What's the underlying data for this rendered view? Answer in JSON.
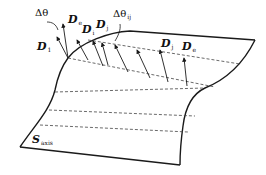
{
  "diagram": {
    "type": "surface-vector-diagram",
    "surface_label": {
      "main": "S",
      "sub": "axis"
    },
    "vector_labels": [
      {
        "main": "D",
        "sub": "1"
      },
      {
        "main": "D",
        "sub": "e"
      },
      {
        "main": "D",
        "sub": "i"
      },
      {
        "main": "D",
        "sub": "j"
      },
      {
        "main": "D",
        "sub": "j"
      },
      {
        "main": "D",
        "sub": "e"
      }
    ],
    "angle_labels": [
      {
        "main": "Δθ",
        "sub": ""
      },
      {
        "main": "Δθ",
        "sub": "ij"
      }
    ],
    "colors": {
      "stroke": "#1a1a1a",
      "dashed": "#444444",
      "background": "#ffffff"
    }
  }
}
